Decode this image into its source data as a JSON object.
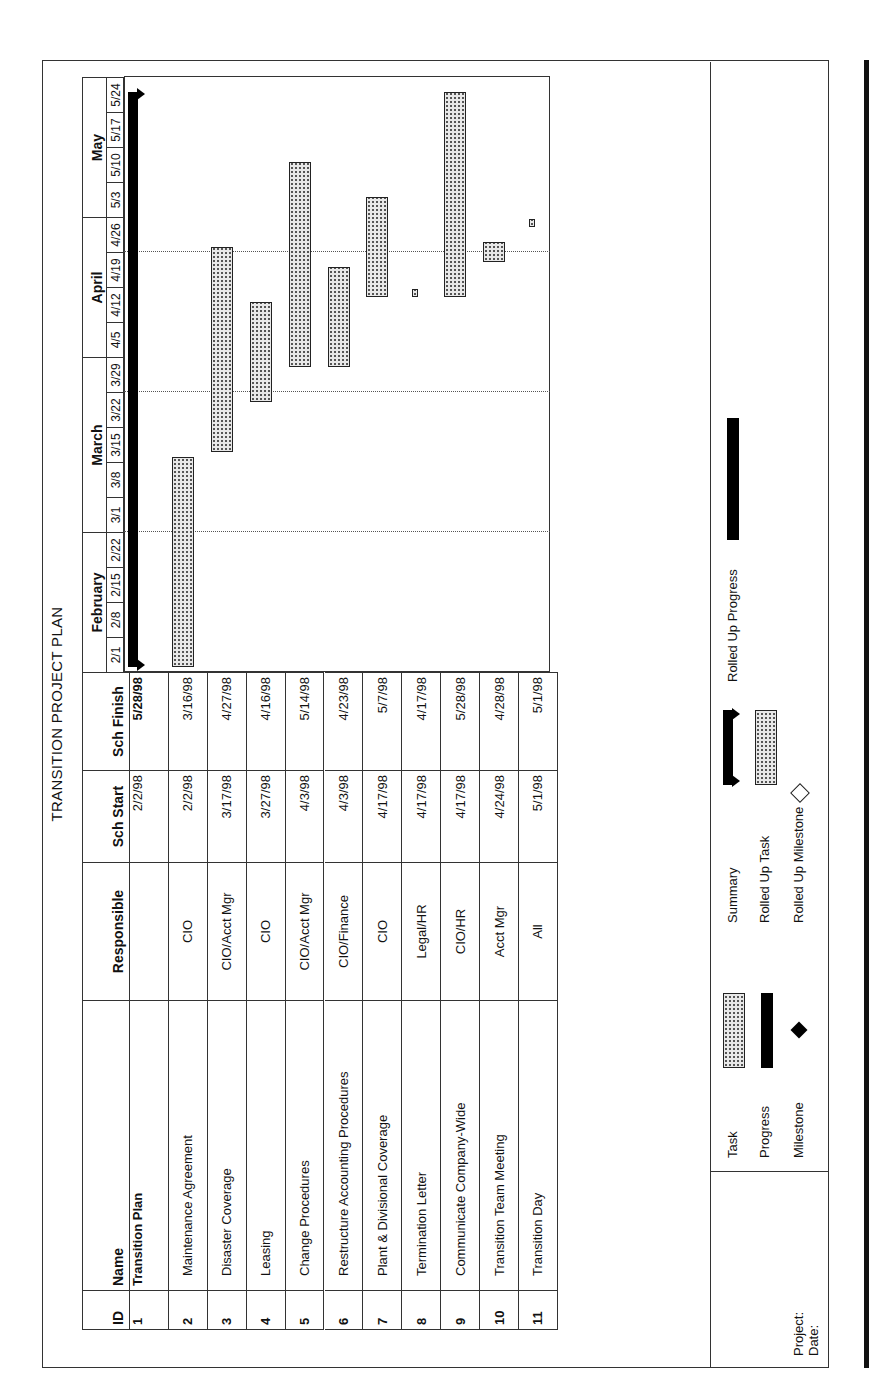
{
  "title": "TRANSITION PROJECT PLAN",
  "columns": {
    "id": "ID",
    "name": "Name",
    "responsible": "Responsible",
    "start": "Sch Start",
    "finish": "Sch Finish"
  },
  "timescale": {
    "months": [
      {
        "label": "February",
        "start_week": 0,
        "weeks": 4
      },
      {
        "label": "March",
        "start_week": 4,
        "weeks": 5
      },
      {
        "label": "April",
        "start_week": 9,
        "weeks": 4
      },
      {
        "label": "May",
        "start_week": 13,
        "weeks": 4
      }
    ],
    "weeks": [
      "2/1",
      "2/8",
      "2/15",
      "2/22",
      "3/1",
      "3/8",
      "3/15",
      "3/22",
      "3/29",
      "4/5",
      "4/12",
      "4/19",
      "4/26",
      "5/3",
      "5/10",
      "5/17",
      "5/24"
    ]
  },
  "tasks": [
    {
      "id": "1",
      "name": "Transition Plan",
      "responsible": "",
      "start": "2/2/98",
      "finish": "5/28/98",
      "summary": true,
      "start_day": 1,
      "end_day": 116
    },
    {
      "id": "2",
      "name": "Maintenance Agreement",
      "responsible": "CIO",
      "start": "2/2/98",
      "finish": "3/16/98",
      "summary": false,
      "start_day": 1,
      "end_day": 43
    },
    {
      "id": "3",
      "name": "Disaster Coverage",
      "responsible": "CIO/Acct Mgr",
      "start": "3/17/98",
      "finish": "4/27/98",
      "summary": false,
      "start_day": 44,
      "end_day": 85
    },
    {
      "id": "4",
      "name": "Leasing",
      "responsible": "CIO",
      "start": "3/27/98",
      "finish": "4/16/98",
      "summary": false,
      "start_day": 54,
      "end_day": 74
    },
    {
      "id": "5",
      "name": "Change Procedures",
      "responsible": "CIO/Acct Mgr",
      "start": "4/3/98",
      "finish": "5/14/98",
      "summary": false,
      "start_day": 61,
      "end_day": 102
    },
    {
      "id": "6",
      "name": "Restructure Accounting Procedures",
      "responsible": "CIO/Finance",
      "start": "4/3/98",
      "finish": "4/23/98",
      "summary": false,
      "start_day": 61,
      "end_day": 81
    },
    {
      "id": "7",
      "name": "Plant & Divisional Coverage",
      "responsible": "CIO",
      "start": "4/17/98",
      "finish": "5/7/98",
      "summary": false,
      "start_day": 75,
      "end_day": 95
    },
    {
      "id": "8",
      "name": "Termination Letter",
      "responsible": "Legal/HR",
      "start": "4/17/98",
      "finish": "4/17/98",
      "summary": false,
      "start_day": 75,
      "end_day": 76
    },
    {
      "id": "9",
      "name": "Communicate Company-Wide",
      "responsible": "CIO/HR",
      "start": "4/17/98",
      "finish": "5/28/98",
      "summary": false,
      "start_day": 75,
      "end_day": 116
    },
    {
      "id": "10",
      "name": "Transition Team Meeting",
      "responsible": "Acct Mgr",
      "start": "4/24/98",
      "finish": "4/28/98",
      "summary": false,
      "start_day": 82,
      "end_day": 86
    },
    {
      "id": "11",
      "name": "Transition Day",
      "responsible": "All",
      "start": "5/1/98",
      "finish": "5/1/98",
      "summary": false,
      "start_day": 89,
      "end_day": 90
    }
  ],
  "legend": {
    "project_label": "Project:",
    "date_label": "Date:",
    "items": [
      {
        "label": "Task",
        "symbol": "task-bar"
      },
      {
        "label": "Progress",
        "symbol": "progress-bar"
      },
      {
        "label": "Milestone",
        "symbol": "milestone-diamond"
      },
      {
        "label": "Summary",
        "symbol": "summary-bar"
      },
      {
        "label": "Rolled Up Task",
        "symbol": "rolled-up-task-bar"
      },
      {
        "label": "Rolled Up Milestone",
        "symbol": "rolled-up-milestone-diamond"
      },
      {
        "label": "Rolled Up Progress",
        "symbol": "rolled-up-progress-bar"
      }
    ]
  },
  "colors": {
    "ink": "#111111",
    "bar_fill": "#e8e8e8",
    "paper": "#ffffff"
  }
}
